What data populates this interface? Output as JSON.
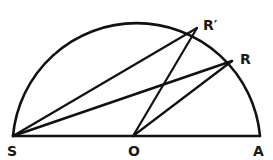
{
  "diagram": {
    "type": "geometry",
    "colors": {
      "stroke": "#111111",
      "background": "#ffffff"
    },
    "points": {
      "S": {
        "label": "S",
        "x": 13,
        "y": 136
      },
      "O": {
        "label": "O",
        "x": 133,
        "y": 136
      },
      "A": {
        "label": "A",
        "x": 260,
        "y": 136
      },
      "R": {
        "label": "R",
        "x": 232,
        "y": 61
      },
      "Rp": {
        "label": "R′",
        "x": 197,
        "y": 28
      }
    },
    "segments": [
      [
        "S",
        "A"
      ],
      [
        "S",
        "Rp"
      ],
      [
        "S",
        "R"
      ],
      [
        "O",
        "Rp"
      ],
      [
        "O",
        "R"
      ]
    ],
    "arc": {
      "from": "S",
      "to": "A",
      "center": "O",
      "radius": 124
    }
  }
}
